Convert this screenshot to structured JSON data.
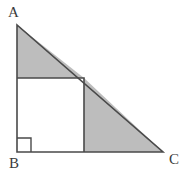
{
  "figure": {
    "canvas": {
      "width": 194,
      "height": 178,
      "background": "#ffffff"
    },
    "style": {
      "shaded_fill": "#bdbdbd",
      "unshaded_fill": "#ffffff",
      "stroke": "#4a4a4a",
      "stroke_width": 1.6,
      "label_color": "#3b3b3b"
    },
    "points": {
      "A": {
        "label": "A",
        "x": 17,
        "y": 25
      },
      "B": {
        "label": "B",
        "x": 17,
        "y": 152
      },
      "C": {
        "label": "C",
        "x": 163,
        "y": 152
      },
      "square_top_left": {
        "x": 17,
        "y": 78
      },
      "square_top_right": {
        "x": 84,
        "y": 78
      },
      "square_bottom_right": {
        "x": 84,
        "y": 152
      },
      "square_bottom_left": {
        "x": 17,
        "y": 152
      }
    },
    "right_angle_mark": {
      "at": "B",
      "x": 17,
      "y": 138,
      "size": 14
    },
    "regions": [
      {
        "name": "upper-shaded-triangle",
        "shaded": true,
        "polygon": "17,25 84,78 17,78"
      },
      {
        "name": "inscribed-square",
        "shaded": false,
        "polygon": "17,78 84,78 84,152 17,152"
      },
      {
        "name": "right-shaded-triangle",
        "shaded": true,
        "polygon": "84,78 163,152 84,152"
      }
    ],
    "labels": {
      "A": "A",
      "B": "B",
      "C": "C"
    }
  }
}
